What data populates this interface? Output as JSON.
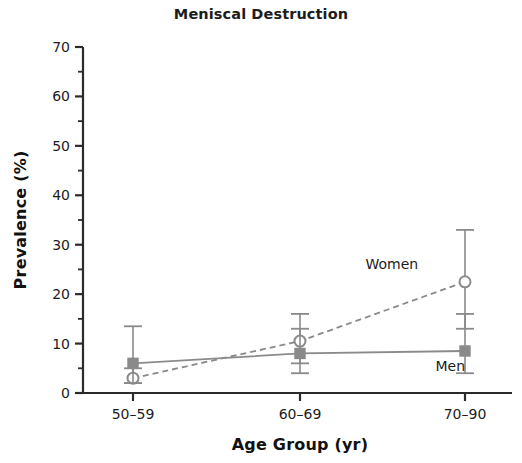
{
  "chart_data": {
    "type": "line",
    "title": "Meniscal Destruction",
    "xlabel": "Age Group (yr)",
    "ylabel": "Prevalence (%)",
    "categories": [
      "50–59",
      "60–69",
      "70–90"
    ],
    "ylim": [
      0,
      70
    ],
    "yticks": [
      0,
      10,
      20,
      30,
      40,
      50,
      60,
      70
    ],
    "yticklabels": [
      "0",
      "10",
      "20",
      "30",
      "40",
      "50",
      "60",
      "70"
    ],
    "yminorticks": [
      5,
      15,
      25,
      35,
      45,
      55,
      65
    ],
    "grid": false,
    "legend_position": "inline-annotations",
    "series": [
      {
        "name": "Women",
        "marker": "open-circle",
        "linestyle": "dashed",
        "color": "#8a8a8a",
        "values": [
          3,
          10.5,
          22.5
        ],
        "err_low": [
          2,
          6,
          13
        ],
        "err_high": [
          5,
          16,
          33
        ],
        "label": "Women"
      },
      {
        "name": "Men",
        "marker": "filled-square",
        "linestyle": "solid",
        "color": "#8a8a8a",
        "values": [
          6,
          8,
          8.5
        ],
        "err_low": [
          2,
          4,
          4
        ],
        "err_high": [
          13.5,
          13,
          16
        ],
        "label": "Men"
      }
    ],
    "annotations": [
      {
        "text": "Women",
        "x": 1.55,
        "y": 26
      },
      {
        "text": "Men",
        "x": 1.9,
        "y": 5.5
      }
    ]
  },
  "colors": {
    "axis": "#2b2b2b",
    "marker": "#8a8a8a",
    "line": "#8a8a8a",
    "text": "#1c1c1c",
    "background": "#ffffff"
  }
}
